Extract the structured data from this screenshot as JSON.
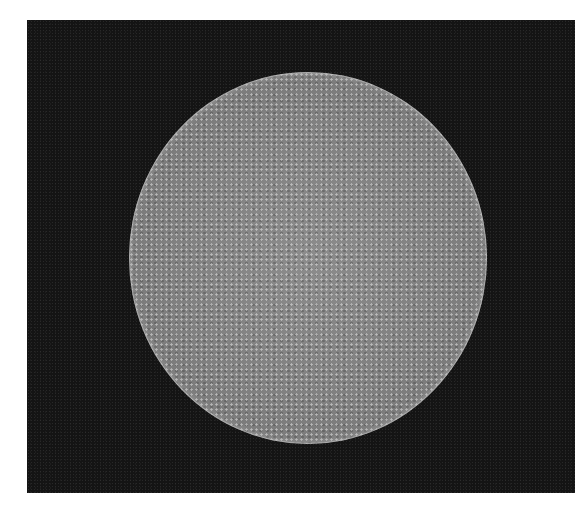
{
  "image": {
    "subject": "mesh-sphere",
    "description": "Grayscale sphere covered in a fine cellular mesh pattern on a black background",
    "colors": {
      "background": "#141414",
      "sphere": "#808080",
      "page": "#ffffff"
    }
  }
}
